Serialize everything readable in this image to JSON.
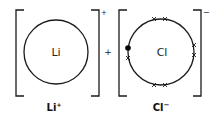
{
  "diagram": {
    "type": "ionic-bonding-dot-cross",
    "operator": "+",
    "ions": [
      {
        "symbol": "Li",
        "label": "Li",
        "charge": "+",
        "outer_electrons": 0
      },
      {
        "symbol": "Cl",
        "label": "Cl",
        "charge": "−",
        "outer_electrons": 8,
        "electrons": {
          "crosses": 7,
          "dots": 1
        }
      }
    ],
    "colors": {
      "stroke": "#1a1a1a",
      "text": "#222222",
      "background": "#ffffff"
    }
  }
}
